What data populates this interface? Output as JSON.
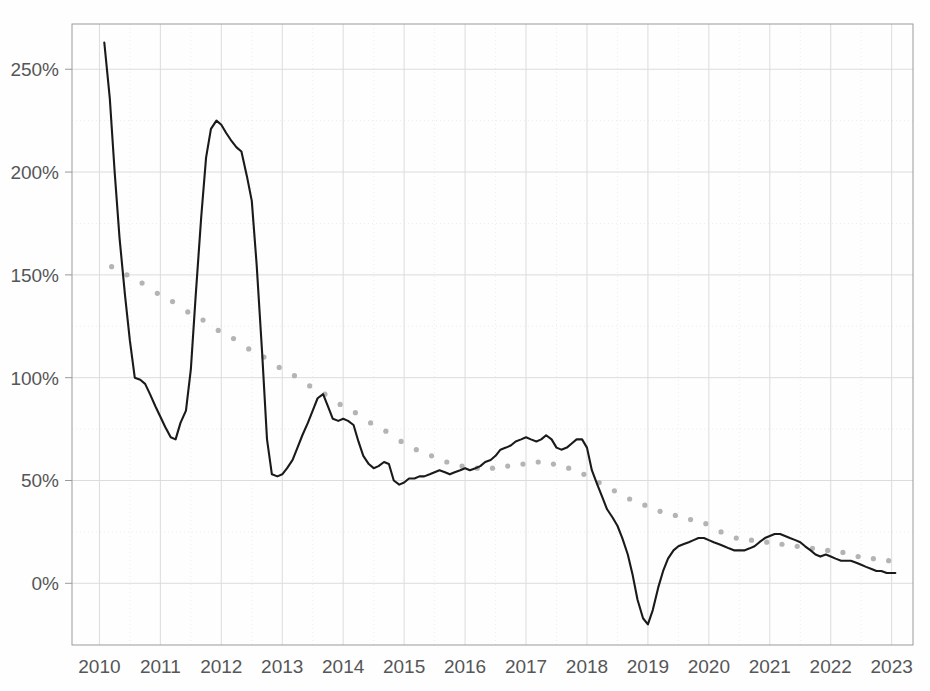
{
  "chart_data": {
    "type": "line",
    "title": "",
    "subtitle": "",
    "xlabel": "",
    "ylabel": "",
    "xlim": [
      2009.55,
      2023.35
    ],
    "ylim": [
      -30,
      272
    ],
    "grid": true,
    "legend": "none",
    "y_tick_labels": [
      "0%",
      "50%",
      "100%",
      "150%",
      "200%",
      "250%"
    ],
    "y_tick_values": [
      0,
      50,
      100,
      150,
      200,
      250
    ],
    "y_minor_tick_values": [
      25,
      75,
      125,
      175,
      225
    ],
    "x_tick_labels": [
      "2010",
      "2011",
      "2012",
      "2013",
      "2014",
      "2015",
      "2016",
      "2017",
      "2018",
      "2019",
      "2020",
      "2021",
      "2022",
      "2023"
    ],
    "x_tick_values": [
      2010,
      2011,
      2012,
      2013,
      2014,
      2015,
      2016,
      2017,
      2018,
      2019,
      2020,
      2021,
      2022,
      2023
    ],
    "colors": {
      "line_solid": "#1a1a1a",
      "line_dotted": "#b4b4b4",
      "grid_major": "#dcdcdc",
      "grid_minor": "#ededed",
      "axis": "#9a9a9a",
      "tick_text": "#555657",
      "background": "#fefefe"
    },
    "series": [
      {
        "name": "observed",
        "style": "solid",
        "color": "#1a1a1a",
        "x": [
          2010.08,
          2010.17,
          2010.25,
          2010.33,
          2010.42,
          2010.5,
          2010.58,
          2010.67,
          2010.75,
          2010.83,
          2010.92,
          2011.0,
          2011.08,
          2011.17,
          2011.25,
          2011.33,
          2011.42,
          2011.5,
          2011.58,
          2011.67,
          2011.75,
          2011.83,
          2011.92,
          2012.0,
          2012.08,
          2012.17,
          2012.25,
          2012.33,
          2012.42,
          2012.5,
          2012.58,
          2012.67,
          2012.75,
          2012.83,
          2012.92,
          2013.0,
          2013.08,
          2013.17,
          2013.25,
          2013.33,
          2013.42,
          2013.5,
          2013.58,
          2013.67,
          2013.75,
          2013.83,
          2013.92,
          2014.0,
          2014.08,
          2014.17,
          2014.25,
          2014.33,
          2014.42,
          2014.5,
          2014.58,
          2014.67,
          2014.75,
          2014.83,
          2014.92,
          2015.0,
          2015.08,
          2015.17,
          2015.25,
          2015.33,
          2015.42,
          2015.5,
          2015.58,
          2015.67,
          2015.75,
          2015.83,
          2015.92,
          2016.0,
          2016.08,
          2016.17,
          2016.25,
          2016.33,
          2016.42,
          2016.5,
          2016.58,
          2016.67,
          2016.75,
          2016.83,
          2016.92,
          2017.0,
          2017.08,
          2017.17,
          2017.25,
          2017.33,
          2017.42,
          2017.5,
          2017.58,
          2017.67,
          2017.75,
          2017.83,
          2017.92,
          2018.0,
          2018.08,
          2018.17,
          2018.25,
          2018.33,
          2018.42,
          2018.5,
          2018.58,
          2018.67,
          2018.75,
          2018.83,
          2018.92,
          2019.0,
          2019.08,
          2019.17,
          2019.25,
          2019.33,
          2019.42,
          2019.5,
          2019.58,
          2019.67,
          2019.75,
          2019.83,
          2019.92,
          2020.0,
          2020.08,
          2020.17,
          2020.25,
          2020.33,
          2020.42,
          2020.5,
          2020.58,
          2020.67,
          2020.75,
          2020.83,
          2020.92,
          2021.0,
          2021.08,
          2021.17,
          2021.25,
          2021.33,
          2021.42,
          2021.5,
          2021.58,
          2021.67,
          2021.75,
          2021.83,
          2021.92,
          2022.0,
          2022.08,
          2022.17,
          2022.25,
          2022.33,
          2022.42,
          2022.5,
          2022.58,
          2022.67,
          2022.75,
          2022.83,
          2022.92,
          2023.0,
          2023.06
        ],
        "y": [
          263,
          236,
          200,
          168,
          140,
          118,
          100,
          99,
          97,
          92,
          86,
          81,
          76,
          71,
          70,
          78,
          84,
          104,
          140,
          178,
          207,
          221,
          225,
          223,
          219,
          215,
          212,
          210,
          198,
          186,
          155,
          112,
          70,
          53,
          52,
          53,
          56,
          60,
          66,
          72,
          78,
          84,
          90,
          92,
          86,
          80,
          79,
          80,
          79,
          77,
          69,
          62,
          58,
          56,
          57,
          59,
          58,
          50,
          48,
          49,
          51,
          51,
          52,
          52,
          53,
          54,
          55,
          54,
          53,
          54,
          55,
          56,
          55,
          56,
          57,
          59,
          60,
          62,
          65,
          66,
          67,
          69,
          70,
          71,
          70,
          69,
          70,
          72,
          70,
          66,
          65,
          66,
          68,
          70,
          70,
          66,
          55,
          48,
          42,
          36,
          32,
          28,
          22,
          14,
          4,
          -8,
          -17,
          -20,
          -13,
          -2,
          6,
          12,
          16,
          18,
          19,
          20,
          21,
          22,
          22,
          21,
          20,
          19,
          18,
          17,
          16,
          16,
          16,
          17,
          18,
          20,
          22,
          23,
          24,
          24,
          23,
          22,
          21,
          20,
          18,
          16,
          14,
          13,
          14,
          13,
          12,
          11,
          11,
          11,
          10,
          9,
          8,
          7,
          6,
          6,
          5,
          5,
          5
        ]
      },
      {
        "name": "trend",
        "style": "dotted",
        "color": "#b4b4b4",
        "x": [
          2010.2,
          2010.45,
          2010.7,
          2010.95,
          2011.2,
          2011.45,
          2011.7,
          2011.95,
          2012.2,
          2012.45,
          2012.7,
          2012.95,
          2013.2,
          2013.45,
          2013.7,
          2013.95,
          2014.2,
          2014.45,
          2014.7,
          2014.95,
          2015.2,
          2015.45,
          2015.7,
          2015.95,
          2016.2,
          2016.45,
          2016.7,
          2016.95,
          2017.2,
          2017.45,
          2017.7,
          2017.95,
          2018.2,
          2018.45,
          2018.7,
          2018.95,
          2019.2,
          2019.45,
          2019.7,
          2019.95,
          2020.2,
          2020.45,
          2020.7,
          2020.95,
          2021.2,
          2021.45,
          2021.7,
          2021.95,
          2022.2,
          2022.45,
          2022.7,
          2022.95
        ],
        "y": [
          154,
          150,
          146,
          141,
          137,
          132,
          128,
          123,
          119,
          114,
          110,
          105,
          101,
          96,
          92,
          87,
          83,
          78,
          74,
          69,
          65,
          62,
          59,
          57,
          56,
          56,
          57,
          58,
          59,
          58,
          56,
          53,
          49,
          45,
          41,
          38,
          35,
          33,
          31,
          29,
          25,
          22,
          21,
          20,
          19,
          18,
          17,
          16,
          15,
          13,
          12,
          11
        ]
      }
    ],
    "annotations": []
  }
}
